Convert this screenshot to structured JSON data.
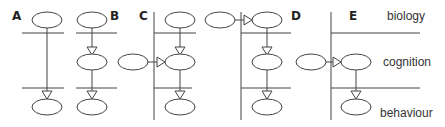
{
  "panels": [
    {
      "label": "A"
    },
    {
      "label": "B"
    },
    {
      "label": "C"
    },
    {
      "label": "D"
    },
    {
      "label": "E"
    }
  ],
  "levels": {
    "top": "biology",
    "middle": "cognition",
    "bottom": "behaviour"
  },
  "colors": {
    "stroke": "#444444",
    "text": "#333333",
    "background": "#ffffff"
  }
}
